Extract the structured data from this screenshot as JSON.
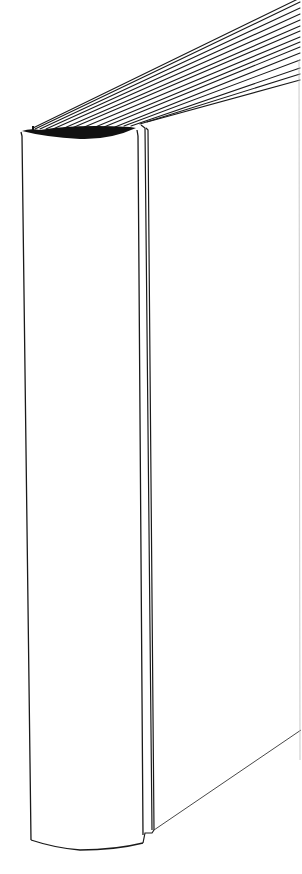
{
  "image": {
    "subject": "Line drawing of a closed book viewed from the spine",
    "background_color": "#ffffff",
    "stroke_color": "#1a1a1a",
    "parts": [
      "page-edges",
      "headband",
      "spine",
      "back-cover-edge",
      "bottom-board-edge"
    ]
  }
}
